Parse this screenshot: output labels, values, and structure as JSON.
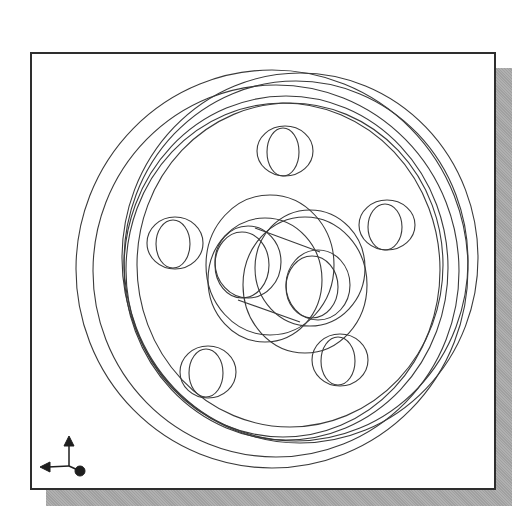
{
  "view": {
    "type": "wireframe-cad-view",
    "subject": "flanged wheel with 5 bolt holes and hub",
    "background_color": "#ffffff",
    "line_color": "#3a3a3a",
    "frame_border_color": "#2e2e2e",
    "shadow_color": "#a9a9a9"
  },
  "geometry": {
    "outer_rims": [
      {
        "cx": 272,
        "cy": 269,
        "rx": 196,
        "ry": 199
      },
      {
        "cx": 276,
        "cy": 271,
        "rx": 183,
        "ry": 186
      }
    ],
    "inner_rims": [
      {
        "cx": 300,
        "cy": 258,
        "rx": 178,
        "ry": 185
      },
      {
        "cx": 296,
        "cy": 261,
        "rx": 172,
        "ry": 180
      },
      {
        "cx": 286,
        "cy": 268,
        "rx": 162,
        "ry": 172
      },
      {
        "cx": 283,
        "cy": 270,
        "rx": 157,
        "ry": 167
      },
      {
        "cx": 290,
        "cy": 265,
        "rx": 153,
        "ry": 162
      }
    ],
    "bolt_holes": [
      {
        "name": "top",
        "front": {
          "cx": 285,
          "cy": 151,
          "rx": 28,
          "ry": 25
        },
        "back": {
          "cx": 283,
          "cy": 152,
          "rx": 16,
          "ry": 24
        }
      },
      {
        "name": "right",
        "front": {
          "cx": 387,
          "cy": 225,
          "rx": 28,
          "ry": 25
        },
        "back": {
          "cx": 385,
          "cy": 227,
          "rx": 17,
          "ry": 23
        }
      },
      {
        "name": "bottom-right",
        "front": {
          "cx": 340,
          "cy": 360,
          "rx": 28,
          "ry": 26
        },
        "back": {
          "cx": 338,
          "cy": 361,
          "rx": 17,
          "ry": 24
        }
      },
      {
        "name": "bottom-left",
        "front": {
          "cx": 208,
          "cy": 372,
          "rx": 28,
          "ry": 26
        },
        "back": {
          "cx": 206,
          "cy": 373,
          "rx": 17,
          "ry": 24
        }
      },
      {
        "name": "left",
        "front": {
          "cx": 175,
          "cy": 243,
          "rx": 28,
          "ry": 26
        },
        "back": {
          "cx": 173,
          "cy": 244,
          "rx": 17,
          "ry": 24
        }
      }
    ],
    "hub": {
      "outer": [
        {
          "cx": 270,
          "cy": 265,
          "rx": 64,
          "ry": 70
        },
        {
          "cx": 305,
          "cy": 285,
          "rx": 62,
          "ry": 68
        },
        {
          "cx": 265,
          "cy": 280,
          "rx": 57,
          "ry": 62
        },
        {
          "cx": 310,
          "cy": 268,
          "rx": 55,
          "ry": 58
        }
      ],
      "bores": [
        {
          "cx": 248,
          "cy": 262,
          "rx": 33,
          "ry": 36
        },
        {
          "cx": 242,
          "cy": 265,
          "rx": 27,
          "ry": 33
        },
        {
          "cx": 318,
          "cy": 285,
          "rx": 32,
          "ry": 35
        },
        {
          "cx": 312,
          "cy": 287,
          "rx": 26,
          "ry": 31
        }
      ],
      "tangent_lines": [
        {
          "x1": 255,
          "y1": 228,
          "x2": 320,
          "y2": 252
        },
        {
          "x1": 238,
          "y1": 300,
          "x2": 300,
          "y2": 322
        }
      ]
    }
  },
  "triad": {
    "origin": {
      "x": 69,
      "y": 466
    },
    "up_arrow_tip": {
      "x": 69,
      "y": 436
    },
    "left_arrow_tip": {
      "x": 40,
      "y": 467
    },
    "dot": {
      "x": 80,
      "y": 471,
      "r": 5
    }
  }
}
